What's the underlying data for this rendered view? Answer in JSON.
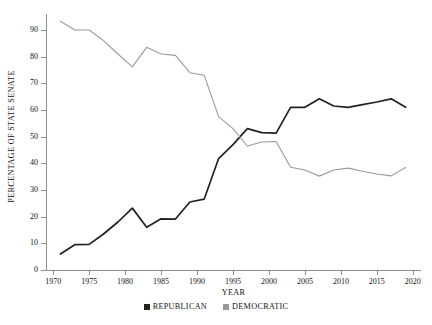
{
  "chart_data": {
    "type": "line",
    "title": "",
    "xlabel": "YEAR",
    "ylabel": "PERCENTAGE OF STATE SENATE",
    "xlim": [
      1969,
      2021
    ],
    "ylim": [
      0,
      96
    ],
    "grid": false,
    "legend_position": "bottom-center",
    "yticks": [
      0,
      10,
      20,
      30,
      40,
      50,
      60,
      70,
      80,
      90
    ],
    "xticks": [
      1970,
      1975,
      1980,
      1985,
      1990,
      1995,
      2000,
      2005,
      2010,
      2015,
      2020
    ],
    "x": [
      1971,
      1973,
      1975,
      1977,
      1979,
      1981,
      1983,
      1985,
      1987,
      1989,
      1991,
      1993,
      1995,
      1997,
      1999,
      2001,
      2003,
      2005,
      2007,
      2009,
      2011,
      2013,
      2015,
      2017,
      2019
    ],
    "series": [
      {
        "name": "REPUBLICAN",
        "color": "#222222",
        "values": [
          6.0,
          9.5,
          9.6,
          13.5,
          18.0,
          23.2,
          16.0,
          19.2,
          19.1,
          25.5,
          26.6,
          41.8,
          47.0,
          53.0,
          51.5,
          51.3,
          61.0,
          61.0,
          64.2,
          61.5,
          61.0,
          62.0,
          63.0,
          64.2,
          61.0
        ]
      },
      {
        "name": "DEMOCRATIC",
        "color": "#9a9a9a",
        "values": [
          93.3,
          90.0,
          90.0,
          86.0,
          81.0,
          76.2,
          83.5,
          81.0,
          80.5,
          74.0,
          73.0,
          57.5,
          53.0,
          46.5,
          48.0,
          48.2,
          38.5,
          37.5,
          35.2,
          37.5,
          38.2,
          37.0,
          36.0,
          35.3,
          38.4
        ]
      }
    ]
  },
  "legend": {
    "entries": [
      {
        "label": "REPUBLICAN",
        "color": "#222222"
      },
      {
        "label": "DEMOCRATIC",
        "color": "#9a9a9a"
      }
    ]
  }
}
